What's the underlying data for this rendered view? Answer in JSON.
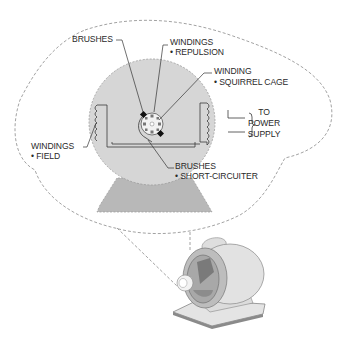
{
  "diagram": {
    "labels": {
      "brushes_top": "BRUSHES",
      "windings_repulsion_line1": "WINDINGS",
      "windings_repulsion_line2": "• REPULSION",
      "winding_squirrel_line1": "WINDING",
      "winding_squirrel_line2": "• SQUIRREL CAGE",
      "power_line1": "TO",
      "power_line2": "POWER",
      "power_line3": "SUPPLY",
      "windings_field_line1": "WINDINGS",
      "windings_field_line2": "• FIELD",
      "brushes_bottom_line1": "BRUSHES",
      "brushes_bottom_line2": "• SHORT-CIRCUITER"
    },
    "colors": {
      "stator_fill": "#d6d6d6",
      "base_fill": "#b8b8b8",
      "outline": "#8a8a8a",
      "text": "#2a2a2a"
    }
  }
}
